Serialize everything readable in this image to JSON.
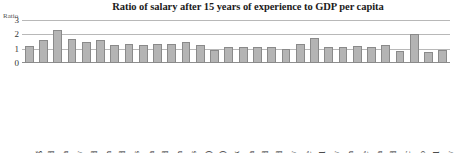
{
  "chart_data": {
    "type": "bar",
    "title": "Ratio of salary after 15 years of experience to GDP per capita",
    "xlabel": "",
    "ylabel": "Ratio",
    "ylim": [
      0,
      3
    ],
    "yticks": [
      0,
      1,
      2,
      3
    ],
    "grid": true,
    "legend": false,
    "bar_color": "#b4b4b4",
    "bar_border_color": "#8a8a8a",
    "categories": [
      "Luxembourg",
      "Switzerland",
      "Korea",
      "Germany",
      "Scotland",
      "Japan",
      "Ireland",
      "Netherlands",
      "Australia",
      "England",
      "Spain",
      "United States",
      "Belgium (Fl.)",
      "Belgium (Fr.)",
      "Denmark",
      "Austria",
      "Finland",
      "New Zealand",
      "Norway",
      "France",
      "Portugal",
      "Italy",
      "Sweden",
      "Greece",
      "Slovenia",
      "Iceland",
      "Czech Republic",
      "Mexico",
      "Israel",
      "Hungary"
    ],
    "values": [
      1.22,
      1.62,
      2.32,
      1.68,
      1.48,
      1.58,
      1.25,
      1.3,
      1.28,
      1.3,
      1.3,
      1.45,
      1.28,
      0.92,
      1.12,
      1.12,
      1.1,
      1.12,
      0.95,
      1.32,
      1.75,
      1.12,
      1.13,
      1.22,
      1.12,
      1.25,
      0.82,
      2.05,
      0.78,
      0.88
    ]
  }
}
